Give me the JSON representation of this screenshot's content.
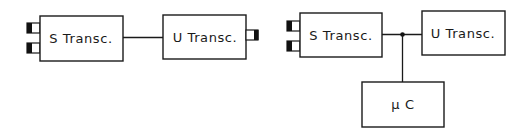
{
  "diagram": {
    "type": "block-diagram",
    "colors": {
      "stroke": "#1a1a1a",
      "background": "#ffffff",
      "connector_fill": "#111111"
    },
    "left": {
      "s_transceiver": {
        "label": "S Transc.",
        "connectors": 2,
        "connector_side": "left"
      },
      "u_transceiver": {
        "label": "U Transc.",
        "connectors": 1,
        "connector_side": "right"
      },
      "links": [
        {
          "from": "S Transc.",
          "to": "U Transc."
        }
      ]
    },
    "right": {
      "s_transceiver": {
        "label": "S Transc.",
        "connectors": 2,
        "connector_side": "left"
      },
      "u_transceiver": {
        "label": "U Transc."
      },
      "microcontroller": {
        "label": "μ C"
      },
      "links": [
        {
          "from": "S Transc.",
          "to": "U Transc.",
          "junction": true
        },
        {
          "from": "junction",
          "to": "μ C"
        }
      ]
    }
  }
}
